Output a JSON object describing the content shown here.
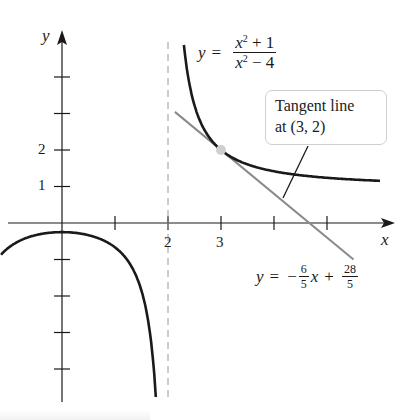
{
  "figure": {
    "function_label": {
      "lhs": "y",
      "eq": "=",
      "numerator": "x",
      "num_exp": "2",
      "num_rest": " + 1",
      "denominator": "x",
      "den_exp": "2",
      "den_rest": " − 4"
    },
    "tangent_label": {
      "lhs": "y",
      "eq": "=",
      "minus": "−",
      "slope_num": "6",
      "slope_den": "5",
      "x": "x",
      "plus": "+",
      "int_num": "28",
      "int_den": "5"
    },
    "callout": {
      "line1": "Tangent line",
      "line2": "at (3, 2)"
    },
    "axis_labels": {
      "x": "x",
      "y": "y"
    },
    "x_tick_labels": [
      {
        "value": 2,
        "text": "2"
      },
      {
        "value": 3,
        "text": "3"
      }
    ],
    "y_tick_labels": [
      {
        "value": 1,
        "text": "1"
      },
      {
        "value": 2,
        "text": "2"
      }
    ]
  },
  "chart_data": {
    "type": "line",
    "title": "",
    "xlabel": "x",
    "ylabel": "y",
    "series": [
      {
        "name": "y = (x^2 + 1)/(x^2 - 4), left branch",
        "domain": [
          -1.15,
          1.77
        ],
        "color": "#1a1a1a"
      },
      {
        "name": "y = (x^2 + 1)/(x^2 - 4), right branch",
        "domain": [
          2.3,
          6.0
        ],
        "color": "#1a1a1a"
      },
      {
        "name": "Tangent line y = -6/5 x + 28/5",
        "domain": [
          2.13,
          5.5
        ],
        "slope": -1.2,
        "intercept": 5.6,
        "color": "#8a8a8a"
      }
    ],
    "asymptote": {
      "x": 2,
      "style": "dashed"
    },
    "point": {
      "x": 3,
      "y": 2,
      "color": "#cfcfcf"
    },
    "x_ticks": [
      1,
      2,
      3,
      4,
      5
    ],
    "y_ticks": [
      -4,
      -3,
      -2,
      -1,
      1,
      2,
      3,
      4
    ],
    "xlim": [
      -1.15,
      6.2
    ],
    "ylim": [
      -5.3,
      5.0
    ],
    "grid": false,
    "legend": "none",
    "annotations": [
      "y = (x^2 + 1)/(x^2 - 4)",
      "Tangent line at (3, 2)",
      "y = -6/5 x + 28/5"
    ]
  }
}
